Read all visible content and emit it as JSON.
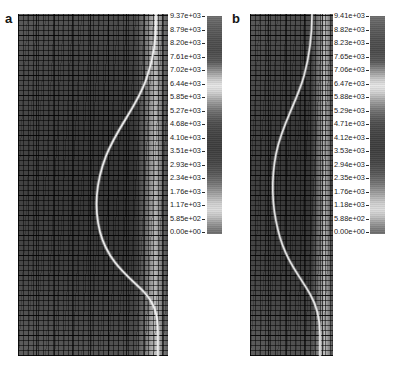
{
  "figure": {
    "type": "contour-plot-pair",
    "background": "#ffffff",
    "colormap": "grayscale-rendered-rainbow"
  },
  "panels": [
    {
      "letter": "a",
      "field_description": "finite element mesh with bright S-shaped shear localisation band",
      "colorbar": {
        "max_label": "9.37e+03",
        "min_label": "0.00e+00",
        "ticks": [
          "9.37e+03",
          "8.79e+03",
          "8.20e+03",
          "7.61e+03",
          "7.02e+03",
          "6.44e+03",
          "5.85e+03",
          "5.27e+03",
          "4.68e+03",
          "4.10e+03",
          "3.51e+03",
          "2.93e+03",
          "2.34e+03",
          "1.76e+03",
          "1.17e+03",
          "5.85e+02",
          "0.00e+00"
        ]
      }
    },
    {
      "letter": "b",
      "field_description": "finite element mesh with bright S-shaped shear localisation band",
      "colorbar": {
        "max_label": "9.41e+03",
        "min_label": "0.00e+00",
        "ticks": [
          "9.41e+03",
          "8.82e+03",
          "8.23e+03",
          "7.65e+03",
          "7.06e+03",
          "6.47e+03",
          "5.88e+03",
          "5.29e+03",
          "4.71e+03",
          "4.12e+03",
          "3.53e+03",
          "2.94e+03",
          "2.35e+03",
          "1.76e+03",
          "1.18e+03",
          "5.88e+02",
          "0.00e+00"
        ]
      }
    }
  ],
  "chart_data": {
    "type": "heatmap",
    "title": "",
    "xlabel": "",
    "ylabel": "",
    "legend_position": "right-of-each-panel",
    "grid": true,
    "series": [
      {
        "name": "a",
        "colorbar_ticks": [
          9370,
          8790,
          8200,
          7610,
          7020,
          6440,
          5850,
          5270,
          4680,
          4100,
          3510,
          2930,
          2340,
          1760,
          1170,
          585,
          0
        ],
        "range": [
          0,
          9370
        ]
      },
      {
        "name": "b",
        "colorbar_ticks": [
          9410,
          8820,
          8230,
          7650,
          7060,
          6470,
          5880,
          5290,
          4710,
          4120,
          3530,
          2940,
          2350,
          1760,
          1180,
          588,
          0
        ],
        "range": [
          0,
          9410
        ]
      }
    ]
  }
}
